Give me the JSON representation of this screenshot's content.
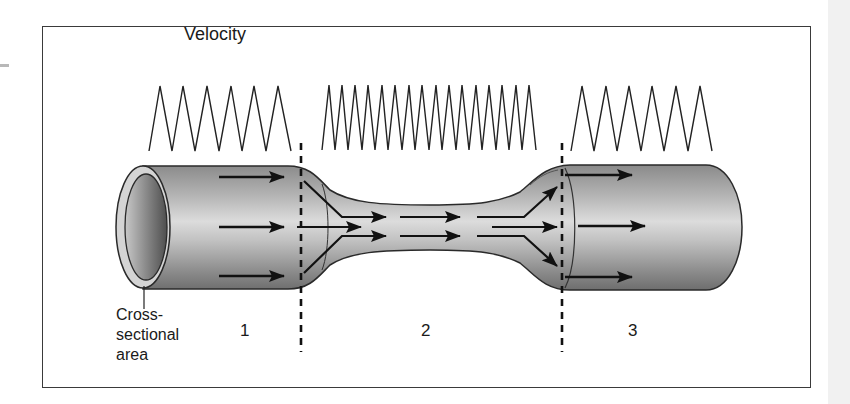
{
  "figure": {
    "title": "Velocity",
    "cross_section_label": "Cross-\nsectional\narea",
    "sections": [
      {
        "label": "1",
        "velocity_waves": 6,
        "description": "wide tube, slow velocity"
      },
      {
        "label": "2",
        "velocity_waves": 16,
        "description": "narrow tube, fast velocity"
      },
      {
        "label": "3",
        "velocity_waves": 6,
        "description": "wide tube, slow velocity"
      }
    ],
    "dividers": 2,
    "colors": {
      "frame": "#3a3a3a",
      "tube_light": "#d6d6d6",
      "tube_dark": "#707070",
      "arrow": "#111111",
      "line": "#222222"
    }
  }
}
